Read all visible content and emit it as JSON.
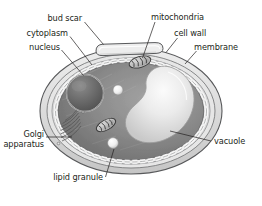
{
  "figure": {
    "name": "yeast-cell-diagram",
    "background_color": "#ffffff",
    "text_color": "#231f20",
    "organism": "yeast cell",
    "view": "cross-section"
  },
  "labels": {
    "bud_scar": "bud scar",
    "cytoplasm": "cytoplasm",
    "nucleus": "nucleus",
    "mitochondria": "mitochondria",
    "cell_wall": "cell wall",
    "membrane": "membrane",
    "golgi_line1": "Golgi",
    "golgi_line2": "apparatus",
    "vacuole": "vacuole",
    "lipid_granule": "lipid granule"
  },
  "structures": [
    {
      "id": "cell-wall",
      "label": "cell wall",
      "fill": "#d9d9d9",
      "stroke": "#58595b"
    },
    {
      "id": "membrane",
      "label": "membrane",
      "fill": "#f2f2f2",
      "stroke": "#58595b",
      "style": "beaded-dashed"
    },
    {
      "id": "cytoplasm",
      "label": "cytoplasm",
      "fill": "#8a8a8a",
      "stroke": "#6d6e70"
    },
    {
      "id": "nucleus",
      "label": "nucleus",
      "fill": "#6e6e6e",
      "stroke": "#d6d6d6"
    },
    {
      "id": "vacuole",
      "label": "vacuole",
      "fill": "#e8e8e8",
      "stroke": "#9a9a9a"
    },
    {
      "id": "mitochondrion-upper",
      "label": "mitochondria",
      "fill": "#b5b5b5",
      "stroke": "#3f3f3f"
    },
    {
      "id": "mitochondrion-lower",
      "label": "mitochondria",
      "fill": "#b5b5b5",
      "stroke": "#3f3f3f"
    },
    {
      "id": "golgi-apparatus",
      "label": "Golgi apparatus",
      "fill": "none",
      "stroke": "#4a4a4a"
    },
    {
      "id": "lipid-granule-upper",
      "label": "lipid granule",
      "fill": "#fbfbfb",
      "stroke": "#8d8d8d"
    },
    {
      "id": "lipid-granule-lower",
      "label": "lipid granule",
      "fill": "#fbfbfb",
      "stroke": "#8d8d8d"
    },
    {
      "id": "bud-scar",
      "label": "bud scar",
      "fill": "#e3e3e3",
      "stroke": "#58595b"
    }
  ],
  "colors": {
    "outline": "#58595b",
    "wall_band": "#d9d9d9",
    "cytoplasm_dark": "#7e7e7e",
    "cytoplasm_light": "#9d9d9d",
    "vacuole_light": "#f4f4f4",
    "nucleus_dark": "#5e5e5e",
    "white": "#ffffff"
  }
}
